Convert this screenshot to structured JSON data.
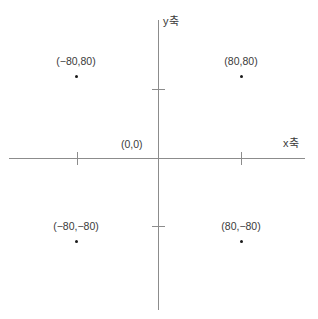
{
  "chart_data": {
    "type": "scatter",
    "title": "",
    "xlabel": "x축",
    "ylabel": "y축",
    "xlim": [
      -146,
      146
    ],
    "ylim": [
      -146,
      146
    ],
    "grid": false,
    "legend": null,
    "axis_colors": {
      "axis": "#8c8c8c",
      "point": "#1a1a1a",
      "text": "#3a3a3a",
      "background": "#ffffff"
    },
    "xticks": [
      -80,
      80
    ],
    "yticks": [
      -80,
      80
    ],
    "xtick_labels": [
      "",
      ""
    ],
    "ytick_labels": [
      "",
      ""
    ],
    "origin_label": "(0,0)",
    "points": [
      {
        "x": -80,
        "y": 80,
        "label": "(−80,80)"
      },
      {
        "x": 80,
        "y": 80,
        "label": "(80,80)"
      },
      {
        "x": -80,
        "y": -80,
        "label": "(−80,−80)"
      },
      {
        "x": 80,
        "y": -80,
        "label": "(80,−80)"
      }
    ]
  }
}
